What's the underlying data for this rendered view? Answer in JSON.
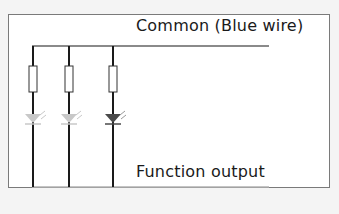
{
  "diagram": {
    "labels": {
      "common": "Common (Blue wire)",
      "output": "Function output"
    },
    "colors": {
      "background": "#f4f4f4",
      "panel": "#ffffff",
      "frame_border": "#7a7a7a",
      "wire": "#1a1a1a",
      "bus_line": "#8a8a8a",
      "resistor_border": "#333333",
      "led_off": "#c8c8c8",
      "led_on": "#4a4a4a"
    },
    "branches": [
      {
        "id": 1,
        "component": "resistor + LED",
        "led_state": "off"
      },
      {
        "id": 2,
        "component": "resistor + LED",
        "led_state": "off"
      },
      {
        "id": 3,
        "component": "resistor + LED",
        "led_state": "on"
      }
    ]
  }
}
